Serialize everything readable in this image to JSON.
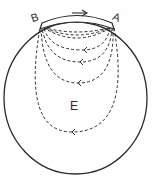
{
  "figure": {
    "labels": {
      "pole_left": "B",
      "pole_right": "A",
      "body": "E",
      "direction_arrow": "→"
    },
    "colors": {
      "stroke": "#2a2a2a",
      "background": "#ffffff"
    }
  }
}
